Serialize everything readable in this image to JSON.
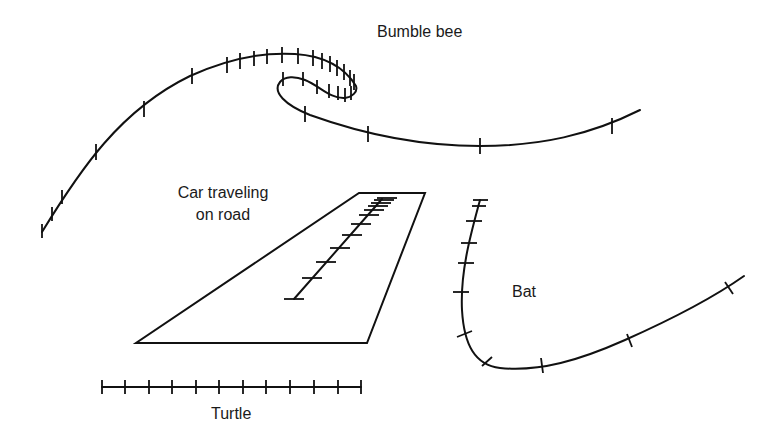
{
  "diagram": {
    "labels": {
      "bumble_bee": "Bumble bee",
      "car": "Car traveling on road",
      "car_line1": "Car traveling",
      "car_line2": "on road",
      "bat": "Bat",
      "turtle": "Turtle"
    },
    "colors": {
      "stroke": "#111111",
      "text": "#1a1a1a",
      "background": "#ffffff"
    },
    "paths": {
      "bumble_bee": {
        "description": "Long curving path with a loop; tick marks denote equal time intervals; ticks densely spaced near the loop (slow) and sparse on straight segments (fast)",
        "tick_count": 31
      },
      "car": {
        "description": "Straight path on a road drawn in perspective; horizontal ticks get closer together with distance",
        "tick_count": 12
      },
      "bat": {
        "description": "Path descending steeply then curving sharply and rising to the right; ticks close on descent then spread out",
        "tick_count": 11
      },
      "turtle": {
        "description": "Straight horizontal path with evenly spaced ticks (constant speed)",
        "tick_count": 12
      }
    }
  }
}
